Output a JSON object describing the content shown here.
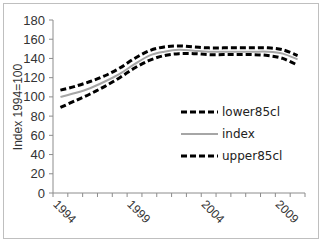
{
  "chart_data": {
    "type": "line",
    "title": "",
    "xlabel": "",
    "ylabel": "Index 1994=100",
    "ylim": [
      0,
      180
    ],
    "yticks": [
      0,
      20,
      40,
      60,
      80,
      100,
      120,
      140,
      160,
      180
    ],
    "x": [
      1994,
      1995,
      1996,
      1997,
      1998,
      1999,
      2000,
      2001,
      2002,
      2003,
      2004,
      2005,
      2006,
      2007,
      2008,
      2009,
      2010
    ],
    "xtick_labels": [
      "1994",
      "1999",
      "2004",
      "2009"
    ],
    "grid": false,
    "legend_position": "right-center",
    "series": [
      {
        "name": "lower85cl",
        "style": "dashed",
        "color": "#000000",
        "values": [
          89,
          96,
          103,
          111,
          120,
          130,
          138,
          143,
          145,
          145,
          144,
          144,
          144,
          144,
          143,
          140,
          133
        ]
      },
      {
        "name": "index",
        "style": "solid",
        "color": "#a6a6a6",
        "values": [
          100,
          104,
          109,
          116,
          124,
          134,
          143,
          147,
          149,
          148,
          147,
          147,
          147,
          147,
          147,
          145,
          139
        ]
      },
      {
        "name": "upper85cl",
        "style": "dashed",
        "color": "#000000",
        "values": [
          107,
          111,
          116,
          122,
          130,
          140,
          148,
          152,
          153,
          152,
          151,
          151,
          151,
          151,
          151,
          149,
          143
        ]
      }
    ]
  },
  "legend": {
    "items": [
      {
        "label": "lower85cl"
      },
      {
        "label": "index"
      },
      {
        "label": "upper85cl"
      }
    ]
  },
  "axis": {
    "ylabel": "Index 1994=100",
    "yticks": [
      "0",
      "20",
      "40",
      "60",
      "80",
      "100",
      "120",
      "140",
      "160",
      "180"
    ],
    "xticks": [
      "1994",
      "1999",
      "2004",
      "2009"
    ]
  }
}
